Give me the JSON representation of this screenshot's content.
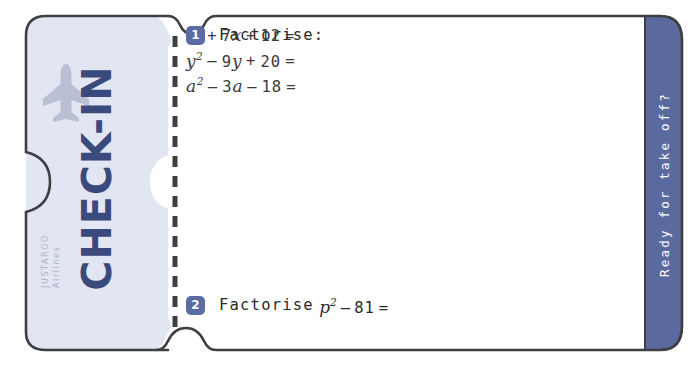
{
  "worksheet": {
    "title": "Check-In Ticket Worksheet",
    "stub": {
      "heading": "CHECK-IN",
      "airline_name": "JUSTAROO",
      "airline_word": "Airlines",
      "plane_icon": "airplane-icon"
    },
    "tagline": "Ready for take off?",
    "questions": [
      {
        "number": "1",
        "prompt": "Factorise:",
        "equations": [
          {
            "id": "eq-1",
            "text": "x2 + 7x + 12 =",
            "parts": [
              {
                "t": "var",
                "v": "x"
              },
              {
                "t": "sup",
                "v": "2"
              },
              {
                "t": "op",
                "v": "+"
              },
              {
                "t": "num",
                "v": "7"
              },
              {
                "t": "var",
                "v": "x"
              },
              {
                "t": "op",
                "v": "+"
              },
              {
                "t": "num",
                "v": "12"
              },
              {
                "t": "op",
                "v": "="
              }
            ]
          },
          {
            "id": "eq-2",
            "text": "y2 - 9y + 20 =",
            "parts": [
              {
                "t": "var",
                "v": "y"
              },
              {
                "t": "sup",
                "v": "2"
              },
              {
                "t": "op",
                "v": "–"
              },
              {
                "t": "num",
                "v": "9"
              },
              {
                "t": "var",
                "v": "y"
              },
              {
                "t": "op",
                "v": "+"
              },
              {
                "t": "num",
                "v": "20"
              },
              {
                "t": "op",
                "v": "="
              }
            ]
          },
          {
            "id": "eq-3",
            "text": "a2 - 3a - 18 =",
            "parts": [
              {
                "t": "var",
                "v": "a"
              },
              {
                "t": "sup",
                "v": "2"
              },
              {
                "t": "op",
                "v": "–"
              },
              {
                "t": "num",
                "v": "3"
              },
              {
                "t": "var",
                "v": "a"
              },
              {
                "t": "op",
                "v": "–"
              },
              {
                "t": "num",
                "v": "18"
              },
              {
                "t": "op",
                "v": "="
              }
            ]
          }
        ]
      },
      {
        "number": "2",
        "prompt": "Factorise",
        "equations": [
          {
            "id": "eq-4",
            "text": "p2 - 81 =",
            "parts": [
              {
                "t": "var",
                "v": "p"
              },
              {
                "t": "sup",
                "v": "2"
              },
              {
                "t": "op",
                "v": "–"
              },
              {
                "t": "num",
                "v": "81"
              },
              {
                "t": "op",
                "v": "="
              }
            ]
          }
        ]
      }
    ],
    "labels": {
      "q1_prompt": "Factorise:",
      "q2_prompt": "Factorise",
      "q2_expr_var": "p",
      "q2_expr_sup": "2",
      "q2_expr_tail": "- 81 ="
    },
    "colors": {
      "strip_blue": "#5a6a9e",
      "badge_blue": "#5b6ba3",
      "heading_navy": "#3b4a7d",
      "stub_fill": "#e2e6f2",
      "outline": "#3f3f43",
      "plane_gray": "#b9c0d4",
      "airline_gray": "#aab2ca"
    }
  }
}
